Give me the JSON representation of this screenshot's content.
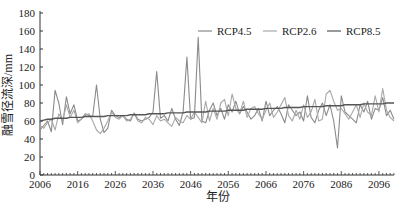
{
  "chart_data": {
    "type": "line",
    "title": "",
    "xlabel": "年份",
    "ylabel": "融雪径流深/mm",
    "ylim": [
      0,
      180
    ],
    "yticks": [
      0,
      20,
      40,
      60,
      80,
      100,
      120,
      140,
      160,
      180
    ],
    "xticks": [
      2006,
      2016,
      2026,
      2036,
      2046,
      2056,
      2066,
      2076,
      2086,
      2096
    ],
    "xlim": [
      2006,
      2100
    ],
    "grid": false,
    "legend_position": "top-right",
    "x": [
      2006,
      2007,
      2008,
      2009,
      2010,
      2011,
      2012,
      2013,
      2014,
      2015,
      2016,
      2017,
      2018,
      2019,
      2020,
      2021,
      2022,
      2023,
      2024,
      2025,
      2026,
      2027,
      2028,
      2029,
      2030,
      2031,
      2032,
      2033,
      2034,
      2035,
      2036,
      2037,
      2038,
      2039,
      2040,
      2041,
      2042,
      2043,
      2044,
      2045,
      2046,
      2047,
      2048,
      2049,
      2050,
      2051,
      2052,
      2053,
      2054,
      2055,
      2056,
      2057,
      2058,
      2059,
      2060,
      2061,
      2062,
      2063,
      2064,
      2065,
      2066,
      2067,
      2068,
      2069,
      2070,
      2071,
      2072,
      2073,
      2074,
      2075,
      2076,
      2077,
      2078,
      2079,
      2080,
      2081,
      2082,
      2083,
      2084,
      2085,
      2086,
      2087,
      2088,
      2089,
      2090,
      2091,
      2092,
      2093,
      2094,
      2095,
      2096,
      2097,
      2098,
      2099,
      2100
    ],
    "series": [
      {
        "name": "RCP4.5",
        "color": "#8a8a8a",
        "values": [
          50,
          55,
          60,
          48,
          94,
          80,
          56,
          87,
          68,
          78,
          60,
          62,
          68,
          66,
          65,
          100,
          62,
          47,
          52,
          72,
          66,
          64,
          66,
          62,
          60,
          69,
          62,
          60,
          62,
          64,
          70,
          115,
          63,
          66,
          60,
          74,
          62,
          55,
          70,
          131,
          62,
          64,
          153,
          60,
          58,
          72,
          80,
          66,
          74,
          62,
          78,
          70,
          82,
          68,
          76,
          70,
          62,
          66,
          74,
          60,
          82,
          66,
          72,
          76,
          68,
          58,
          78,
          72,
          66,
          70,
          60,
          88,
          64,
          58,
          72,
          80,
          66,
          78,
          60,
          30,
          88,
          70,
          66,
          62,
          58,
          78,
          70,
          82,
          62,
          74,
          72,
          86,
          66,
          72,
          62
        ]
      },
      {
        "name": "RCP2.6",
        "color": "#a8a8a8",
        "values": [
          55,
          52,
          58,
          62,
          50,
          68,
          60,
          78,
          64,
          72,
          58,
          62,
          66,
          68,
          60,
          50,
          46,
          52,
          60,
          70,
          64,
          62,
          66,
          60,
          62,
          68,
          60,
          58,
          64,
          62,
          56,
          66,
          60,
          62,
          58,
          54,
          64,
          60,
          58,
          66,
          62,
          70,
          64,
          58,
          82,
          60,
          74,
          62,
          80,
          84,
          66,
          90,
          74,
          68,
          82,
          64,
          74,
          76,
          68,
          62,
          72,
          80,
          64,
          70,
          78,
          86,
          66,
          60,
          72,
          62,
          78,
          64,
          70,
          84,
          60,
          62,
          90,
          94,
          82,
          72,
          74,
          68,
          62,
          70,
          78,
          64,
          80,
          70,
          66,
          88,
          70,
          96,
          72,
          64,
          60
        ]
      },
      {
        "name": "RCP8.5",
        "color": "#555555",
        "values": [
          60,
          61,
          62,
          62,
          63,
          63,
          63,
          63,
          64,
          64,
          64,
          64,
          65,
          65,
          65,
          65,
          65,
          65,
          66,
          66,
          66,
          66,
          66,
          66,
          67,
          67,
          67,
          67,
          67,
          68,
          68,
          68,
          68,
          68,
          69,
          69,
          69,
          69,
          69,
          70,
          70,
          70,
          70,
          70,
          70,
          71,
          71,
          71,
          71,
          71,
          72,
          72,
          72,
          72,
          72,
          73,
          73,
          73,
          73,
          73,
          74,
          74,
          74,
          74,
          74,
          75,
          75,
          75,
          75,
          75,
          76,
          76,
          76,
          76,
          76,
          76,
          77,
          77,
          77,
          77,
          77,
          78,
          78,
          78,
          78,
          78,
          79,
          79,
          79,
          79,
          79,
          79,
          80,
          80,
          80
        ]
      }
    ]
  },
  "legend": {
    "items": [
      {
        "label": "RCP4.5",
        "color": "#8a8a8a"
      },
      {
        "label": "RCP2.6",
        "color": "#a8a8a8"
      },
      {
        "label": "RCP8.5",
        "color": "#555555"
      }
    ]
  },
  "axes": {
    "xlabel": "年份",
    "ylabel": "融雪径流深/mm"
  }
}
